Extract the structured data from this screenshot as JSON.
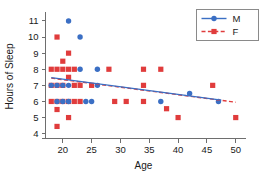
{
  "chart_data": {
    "type": "scatter",
    "title": "",
    "xlabel": "Age",
    "ylabel": "Hours of Sleep",
    "xlim": [
      17,
      51
    ],
    "ylim": [
      3.7,
      11.4
    ],
    "xticks": [
      20,
      25,
      30,
      35,
      40,
      45,
      50
    ],
    "yticks": [
      4,
      5,
      6,
      7,
      8,
      9,
      10,
      11
    ],
    "grid": false,
    "legend_position": "top-right",
    "colors": {
      "M": "#3b6fc4",
      "F": "#e03c3c",
      "axis": "#6e6e6e",
      "text": "#1a1a1a",
      "background": "#ffffff"
    },
    "series": [
      {
        "name": "M",
        "label": "M",
        "marker": "circle",
        "color": "#3b6fc4",
        "linestyle": "solid",
        "points": [
          [
            21,
            11
          ],
          [
            23,
            10
          ],
          [
            23,
            8
          ],
          [
            26,
            8
          ],
          [
            18,
            7
          ],
          [
            19,
            7
          ],
          [
            20,
            7
          ],
          [
            21,
            7
          ],
          [
            26,
            7
          ],
          [
            19,
            6
          ],
          [
            20,
            6
          ],
          [
            21,
            6
          ],
          [
            24,
            6
          ],
          [
            25,
            6
          ],
          [
            37,
            6
          ],
          [
            42,
            6.5
          ],
          [
            47,
            6
          ]
        ],
        "trendline": {
          "x": [
            18,
            47.5
          ],
          "y": [
            7.48,
            6.08
          ]
        }
      },
      {
        "name": "F",
        "label": "F",
        "marker": "square",
        "color": "#e03c3c",
        "linestyle": "dashed",
        "points": [
          [
            19,
            10
          ],
          [
            21,
            9
          ],
          [
            20,
            8.5
          ],
          [
            18,
            8
          ],
          [
            19,
            8
          ],
          [
            20,
            8
          ],
          [
            21,
            8
          ],
          [
            22,
            8
          ],
          [
            28,
            8
          ],
          [
            34,
            8
          ],
          [
            37,
            8
          ],
          [
            18,
            7
          ],
          [
            19,
            7
          ],
          [
            20,
            7
          ],
          [
            21,
            7.5
          ],
          [
            22,
            7
          ],
          [
            23,
            7
          ],
          [
            25,
            7
          ],
          [
            34,
            7
          ],
          [
            46,
            7
          ],
          [
            18,
            6
          ],
          [
            19,
            6
          ],
          [
            20,
            6
          ],
          [
            21,
            6
          ],
          [
            22,
            6
          ],
          [
            23,
            6
          ],
          [
            29,
            6
          ],
          [
            31,
            6
          ],
          [
            34,
            6
          ],
          [
            38,
            5.55
          ],
          [
            19,
            5.5
          ],
          [
            21,
            5
          ],
          [
            40,
            5
          ],
          [
            50,
            5
          ],
          [
            19,
            4.45
          ]
        ],
        "trendline": {
          "x": [
            18,
            50
          ],
          "y": [
            7.45,
            5.95
          ]
        }
      }
    ]
  },
  "legend": {
    "entries": [
      {
        "label": "M",
        "marker": "circle",
        "color": "#3b6fc4",
        "linestyle": "solid"
      },
      {
        "label": "F",
        "marker": "square",
        "color": "#e03c3c",
        "linestyle": "dashed"
      }
    ]
  },
  "axes": {
    "x_title": "Age",
    "y_title": "Hours of Sleep",
    "x_tick_labels": [
      "20",
      "25",
      "30",
      "35",
      "40",
      "45",
      "50"
    ],
    "y_tick_labels": [
      "4",
      "5",
      "6",
      "7",
      "8",
      "9",
      "10",
      "11"
    ]
  }
}
